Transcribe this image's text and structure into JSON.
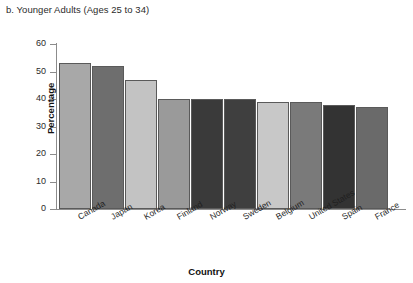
{
  "panel": {
    "title": "b. Younger Adults (Ages 25 to 34)"
  },
  "chart_data": {
    "type": "bar",
    "title": "b. Younger Adults (Ages 25 to 34)",
    "xlabel": "Country",
    "ylabel": "Percentage",
    "categories": [
      "Canada",
      "Japan",
      "Korea",
      "Finland",
      "Norway",
      "Sweden",
      "Belgium",
      "United States",
      "Spain",
      "France"
    ],
    "values": [
      53,
      52,
      47,
      40,
      40,
      40,
      39,
      39,
      38,
      37
    ],
    "bar_colors": [
      "#a8a8a8",
      "#6e6e6e",
      "#c3c3c3",
      "#9a9a9a",
      "#3a3a3a",
      "#3f3f3f",
      "#c8c8c8",
      "#7a7a7a",
      "#333333",
      "#6a6a6a"
    ],
    "ylim": [
      0,
      60
    ],
    "yticks": [
      0,
      10,
      20,
      30,
      40,
      50,
      60
    ],
    "ytick_labels": [
      "0",
      "10",
      "20",
      "30",
      "40",
      "50",
      "60"
    ],
    "grid": false,
    "legend": "none",
    "xtick_rotation": -30
  }
}
